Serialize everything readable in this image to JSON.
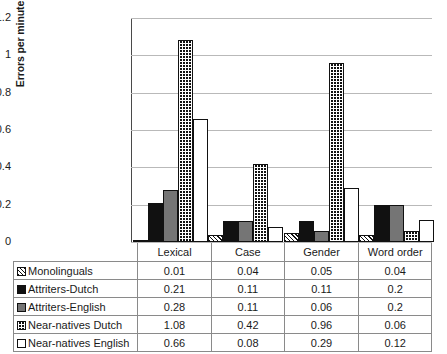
{
  "chart_data": {
    "type": "bar",
    "title": "",
    "xlabel": "",
    "ylabel": "Errors per minute",
    "ylim": [
      0,
      1.2
    ],
    "ytick_labels": [
      "1.2",
      "1",
      "0.8",
      "0.6",
      "0.4",
      "0.2",
      "0"
    ],
    "ytick_values": [
      1.2,
      1.0,
      0.8,
      0.6,
      0.4,
      0.2,
      0
    ],
    "grid": true,
    "legend_position": "table-below",
    "categories": [
      "Lexical",
      "Case",
      "Gender",
      "Word order"
    ],
    "series": [
      {
        "name": "Monolinguals",
        "pattern": "diagonal-hatch",
        "values": [
          0.01,
          0.04,
          0.05,
          0.04
        ],
        "labels": [
          "0.01",
          "0.04",
          "0.05",
          "0.04"
        ]
      },
      {
        "name": "Attriters-Dutch",
        "pattern": "solid-black",
        "values": [
          0.21,
          0.11,
          0.11,
          0.2
        ],
        "labels": [
          "0.21",
          "0.11",
          "0.11",
          "0.2"
        ]
      },
      {
        "name": "Attriters-English",
        "pattern": "solid-gray",
        "values": [
          0.28,
          0.11,
          0.06,
          0.2
        ],
        "labels": [
          "0.28",
          "0.11",
          "0.06",
          "0.2"
        ]
      },
      {
        "name": "Near-natives Dutch",
        "pattern": "checkerboard",
        "values": [
          1.08,
          0.42,
          0.96,
          0.06
        ],
        "labels": [
          "1.08",
          "0.42",
          "0.96",
          "0.06"
        ]
      },
      {
        "name": "Near-natives English",
        "pattern": "white",
        "values": [
          0.66,
          0.08,
          0.29,
          0.12
        ],
        "labels": [
          "0.66",
          "0.08",
          "0.29",
          "0.12"
        ]
      }
    ]
  },
  "axis": {
    "y_title": "Errors per minute",
    "ticks": [
      {
        "label": "1.2"
      },
      {
        "label": "1"
      },
      {
        "label": "0.8"
      },
      {
        "label": "0.6"
      },
      {
        "label": "0.4"
      },
      {
        "label": "0.2"
      },
      {
        "label": "0"
      }
    ]
  },
  "table": {
    "header": {
      "corner": "",
      "columns": [
        "Lexical",
        "Case",
        "Gender",
        "Word order"
      ]
    },
    "rows": [
      {
        "label": "Monolinguals",
        "swatch": "diagonal-hatch-swatch",
        "values": [
          "0.01",
          "0.04",
          "0.05",
          "0.04"
        ]
      },
      {
        "label": "Attriters-Dutch",
        "swatch": "solid-black-swatch",
        "values": [
          "0.21",
          "0.11",
          "0.11",
          "0.2"
        ]
      },
      {
        "label": "Attriters-English",
        "swatch": "solid-gray-swatch",
        "values": [
          "0.28",
          "0.11",
          "0.06",
          "0.2"
        ]
      },
      {
        "label": "Near-natives Dutch",
        "swatch": "checkerboard-swatch",
        "values": [
          "1.08",
          "0.42",
          "0.96",
          "0.06"
        ]
      },
      {
        "label": "Near-natives English",
        "swatch": "white-swatch",
        "values": [
          "0.66",
          "0.08",
          "0.29",
          "0.12"
        ]
      }
    ]
  },
  "colors": {
    "bar_outline": "#111111",
    "solid_black": "#111111",
    "solid_gray": "#757575",
    "white": "#ffffff",
    "gridline": "#b9b9b9",
    "axis": "#4a4a4a",
    "table_border": "#8a8a8a"
  }
}
